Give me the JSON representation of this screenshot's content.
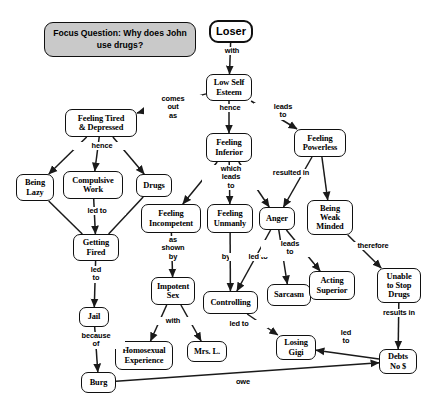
{
  "diagram": {
    "type": "concept-map",
    "canvas": {
      "width": 440,
      "height": 410
    },
    "style": {
      "node_fill": "#ffffff",
      "node_stroke": "#101010",
      "focus_fill": "#c9c9c9",
      "background": "#ffffff",
      "line_color": "#1a1a1a"
    },
    "nodes": [
      {
        "id": "focus",
        "label": "Focus Question: Why does John use drugs?",
        "x": 44,
        "y": 22,
        "w": 152,
        "h": 35,
        "kind": "focus"
      },
      {
        "id": "loser",
        "label": "Loser",
        "x": 209,
        "y": 20,
        "w": 44,
        "h": 23,
        "kind": "root"
      },
      {
        "id": "low_self",
        "label": "Low Self\nEsteem",
        "x": 206,
        "y": 74,
        "w": 46,
        "h": 27,
        "kind": "node"
      },
      {
        "id": "tired",
        "label": "Feeling Tired\n& Depressed",
        "x": 65,
        "y": 109,
        "w": 72,
        "h": 28,
        "kind": "node"
      },
      {
        "id": "inferior",
        "label": "Feeling\nInferior",
        "x": 206,
        "y": 133,
        "w": 46,
        "h": 29,
        "kind": "node"
      },
      {
        "id": "powerless",
        "label": "Feeling\nPowerless",
        "x": 294,
        "y": 129,
        "w": 52,
        "h": 28,
        "kind": "node"
      },
      {
        "id": "lazy",
        "label": "Being\nLazy",
        "x": 16,
        "y": 174,
        "w": 38,
        "h": 27,
        "kind": "node"
      },
      {
        "id": "compulsive",
        "label": "Compulsive\nWork",
        "x": 63,
        "y": 171,
        "w": 60,
        "h": 28,
        "kind": "node"
      },
      {
        "id": "drugs",
        "label": "Drugs",
        "x": 136,
        "y": 174,
        "w": 36,
        "h": 23,
        "kind": "node"
      },
      {
        "id": "incompetent",
        "label": "Feeling\nIncompetent",
        "x": 141,
        "y": 204,
        "w": 60,
        "h": 29,
        "kind": "node"
      },
      {
        "id": "unmanly",
        "label": "Feeling\nUnmanly",
        "x": 207,
        "y": 204,
        "w": 46,
        "h": 29,
        "kind": "node"
      },
      {
        "id": "anger",
        "label": "Anger",
        "x": 259,
        "y": 207,
        "w": 36,
        "h": 23,
        "kind": "node"
      },
      {
        "id": "weak",
        "label": "Being\nWeak\nMinded",
        "x": 307,
        "y": 200,
        "w": 46,
        "h": 35,
        "kind": "node"
      },
      {
        "id": "fired",
        "label": "Getting\nFired",
        "x": 73,
        "y": 234,
        "w": 46,
        "h": 27,
        "kind": "node"
      },
      {
        "id": "sarcasm",
        "label": "Sarcasm",
        "x": 267,
        "y": 284,
        "w": 44,
        "h": 22,
        "kind": "node"
      },
      {
        "id": "superior",
        "label": "Acting\nSuperior",
        "x": 309,
        "y": 271,
        "w": 46,
        "h": 29,
        "kind": "node"
      },
      {
        "id": "unable",
        "label": "Unable\nto Stop\nDrugs",
        "x": 377,
        "y": 268,
        "w": 44,
        "h": 35,
        "kind": "node"
      },
      {
        "id": "impotent",
        "label": "Impotent\nSex",
        "x": 151,
        "y": 277,
        "w": 44,
        "h": 28,
        "kind": "node"
      },
      {
        "id": "controlling",
        "label": "Controlling",
        "x": 203,
        "y": 291,
        "w": 55,
        "h": 23,
        "kind": "node"
      },
      {
        "id": "jail",
        "label": "Jail",
        "x": 79,
        "y": 307,
        "w": 30,
        "h": 20,
        "kind": "node"
      },
      {
        "id": "losing",
        "label": "Losing\nGigi",
        "x": 276,
        "y": 335,
        "w": 40,
        "h": 25,
        "kind": "node"
      },
      {
        "id": "debts",
        "label": "Debts\nNo $",
        "x": 379,
        "y": 349,
        "w": 38,
        "h": 25,
        "kind": "node"
      },
      {
        "id": "homosexual",
        "label": "Homosexual\nExperience",
        "x": 115,
        "y": 341,
        "w": 58,
        "h": 29,
        "kind": "node"
      },
      {
        "id": "mrsl",
        "label": "Mrs. L.",
        "x": 187,
        "y": 341,
        "w": 40,
        "h": 21,
        "kind": "node"
      },
      {
        "id": "burg",
        "label": "Burg",
        "x": 81,
        "y": 372,
        "w": 35,
        "h": 21,
        "kind": "node"
      }
    ],
    "edges": [
      {
        "from": "loser",
        "to": "low_self",
        "label": "with",
        "lx": 231,
        "ly": 52,
        "arrow": true
      },
      {
        "from": "low_self",
        "to": "tired",
        "label": "comes\nout\nas",
        "lx": 172,
        "ly": 100,
        "arrow": true
      },
      {
        "from": "low_self",
        "to": "inferior",
        "label": "hence",
        "lx": 229,
        "ly": 109,
        "arrow": true
      },
      {
        "from": "low_self",
        "to": "powerless",
        "label": "leads\nto",
        "lx": 282,
        "ly": 108,
        "arrow": true
      },
      {
        "from": "tired",
        "to": "lazy",
        "label": "hence",
        "lx": 101,
        "ly": 147,
        "arrow": true
      },
      {
        "from": "tired",
        "to": "compulsive",
        "label": "",
        "arrow": true
      },
      {
        "from": "tired",
        "to": "drugs",
        "label": "",
        "arrow": true
      },
      {
        "from": "compulsive",
        "to": "fired",
        "label": "led to",
        "lx": 96,
        "ly": 212,
        "arrow": true
      },
      {
        "from": "lazy",
        "to": "fired",
        "label": "",
        "arrow": false
      },
      {
        "from": "drugs",
        "to": "fired",
        "label": "",
        "arrow": false
      },
      {
        "from": "fired",
        "to": "jail",
        "label": "led\nto",
        "lx": 95,
        "ly": 271,
        "arrow": true
      },
      {
        "from": "jail",
        "to": "burg",
        "label": "because\nof",
        "lx": 95,
        "ly": 337,
        "arrow": true
      },
      {
        "from": "inferior",
        "to": "incompetent",
        "label": "which\nleads\nto",
        "lx": 230,
        "ly": 170,
        "arrow": true
      },
      {
        "from": "inferior",
        "to": "unmanly",
        "label": "",
        "arrow": true
      },
      {
        "from": "inferior",
        "to": "anger",
        "label": "",
        "arrow": true
      },
      {
        "from": "powerless",
        "to": "anger",
        "label": "resulted in",
        "lx": 290,
        "ly": 174,
        "arrow": true
      },
      {
        "from": "powerless",
        "to": "weak",
        "label": "",
        "arrow": true
      },
      {
        "from": "incompetent",
        "to": "impotent",
        "label": "as\nshown\nby",
        "lx": 172,
        "ly": 241,
        "arrow": true
      },
      {
        "from": "unmanly",
        "to": "controlling",
        "label": "by",
        "lx": 225,
        "ly": 258,
        "arrow": true
      },
      {
        "from": "anger",
        "to": "controlling",
        "label": "led to",
        "lx": 257,
        "ly": 258,
        "arrow": true
      },
      {
        "from": "anger",
        "to": "sarcasm",
        "label": "leads\nto",
        "lx": 289,
        "ly": 245,
        "arrow": true
      },
      {
        "from": "anger",
        "to": "superior",
        "label": "",
        "arrow": true
      },
      {
        "from": "weak",
        "to": "unable",
        "label": "therefore",
        "lx": 372,
        "ly": 247,
        "arrow": true
      },
      {
        "from": "unable",
        "to": "debts",
        "label": "results in",
        "lx": 398,
        "ly": 314,
        "arrow": true
      },
      {
        "from": "impotent",
        "to": "homosexual",
        "label": "with",
        "lx": 172,
        "ly": 322,
        "arrow": true
      },
      {
        "from": "impotent",
        "to": "mrsl",
        "label": "",
        "arrow": true
      },
      {
        "from": "controlling",
        "to": "losing",
        "label": "led to",
        "lx": 238,
        "ly": 325,
        "arrow": true
      },
      {
        "from": "debts",
        "to": "losing",
        "label": "led\nto",
        "lx": 345,
        "ly": 334,
        "arrow": true
      },
      {
        "from": "burg",
        "to": "debts",
        "label": "owe",
        "lx": 242,
        "ly": 383,
        "arrow": true
      }
    ]
  }
}
